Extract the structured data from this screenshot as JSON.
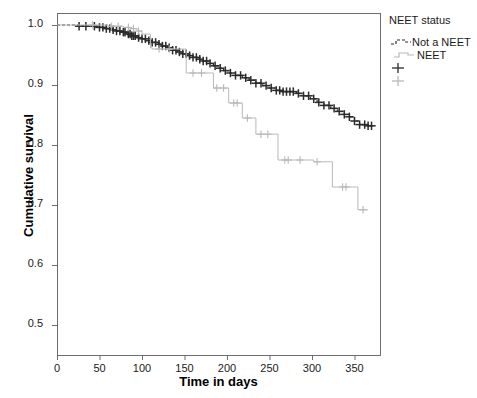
{
  "chart_data": {
    "type": "line",
    "title": "",
    "xlabel": "Time in days",
    "ylabel": "Cumulative survival",
    "xlim": [
      0,
      380
    ],
    "ylim": [
      0.45,
      1.02
    ],
    "xticks": [
      0,
      50,
      100,
      150,
      200,
      250,
      300,
      350
    ],
    "yticks": [
      0.5,
      0.6,
      0.7,
      0.8,
      0.9,
      1.0
    ],
    "ytick_labels": [
      "0.5",
      "0.6",
      "0.7",
      "0.8",
      "0.9",
      "1.0"
    ],
    "xtick_labels": [
      "0",
      "50",
      "100",
      "150",
      "200",
      "250",
      "300",
      "350"
    ],
    "grid": false,
    "legend_position": "right",
    "legend_title": "NEET status",
    "series": [
      {
        "name": "Not a NEET",
        "color": "#2b2b2b",
        "style": "dashed",
        "points": [
          [
            0,
            1.0
          ],
          [
            18,
            1.0
          ],
          [
            24,
            0.998
          ],
          [
            34,
            0.998
          ],
          [
            46,
            0.996
          ],
          [
            52,
            0.996
          ],
          [
            58,
            0.994
          ],
          [
            64,
            0.992
          ],
          [
            70,
            0.99
          ],
          [
            76,
            0.988
          ],
          [
            82,
            0.985
          ],
          [
            88,
            0.982
          ],
          [
            94,
            0.979
          ],
          [
            100,
            0.977
          ],
          [
            106,
            0.974
          ],
          [
            112,
            0.971
          ],
          [
            118,
            0.968
          ],
          [
            124,
            0.965
          ],
          [
            130,
            0.962
          ],
          [
            136,
            0.958
          ],
          [
            142,
            0.955
          ],
          [
            148,
            0.952
          ],
          [
            154,
            0.949
          ],
          [
            160,
            0.946
          ],
          [
            166,
            0.943
          ],
          [
            172,
            0.94
          ],
          [
            178,
            0.936
          ],
          [
            184,
            0.932
          ],
          [
            190,
            0.928
          ],
          [
            196,
            0.924
          ],
          [
            202,
            0.92
          ],
          [
            210,
            0.916
          ],
          [
            218,
            0.912
          ],
          [
            226,
            0.908
          ],
          [
            234,
            0.903
          ],
          [
            242,
            0.899
          ],
          [
            250,
            0.895
          ],
          [
            258,
            0.891
          ],
          [
            266,
            0.889
          ],
          [
            274,
            0.889
          ],
          [
            282,
            0.886
          ],
          [
            290,
            0.882
          ],
          [
            298,
            0.877
          ],
          [
            306,
            0.871
          ],
          [
            314,
            0.866
          ],
          [
            322,
            0.861
          ],
          [
            330,
            0.856
          ],
          [
            338,
            0.851
          ],
          [
            344,
            0.847
          ],
          [
            350,
            0.84
          ],
          [
            356,
            0.834
          ],
          [
            366,
            0.832
          ],
          [
            372,
            0.832
          ]
        ],
        "censor_times": [
          26,
          34,
          44,
          50,
          54,
          58,
          62,
          66,
          70,
          74,
          78,
          80,
          84,
          86,
          88,
          90,
          92,
          96,
          100,
          104,
          108,
          112,
          116,
          120,
          124,
          128,
          132,
          136,
          140,
          144,
          148,
          152,
          156,
          160,
          164,
          168,
          172,
          176,
          180,
          186,
          192,
          198,
          204,
          210,
          216,
          222,
          228,
          234,
          240,
          246,
          252,
          258,
          262,
          266,
          270,
          274,
          278,
          284,
          290,
          296,
          302,
          308,
          314,
          320,
          326,
          332,
          338,
          344,
          350,
          356,
          362,
          366,
          370
        ]
      },
      {
        "name": "NEET",
        "color": "#b8b8b8",
        "style": "solid",
        "points": [
          [
            0,
            1.0
          ],
          [
            30,
            1.0
          ],
          [
            60,
            0.998
          ],
          [
            78,
            0.996
          ],
          [
            86,
            0.994
          ],
          [
            94,
            0.99
          ],
          [
            100,
            0.985
          ],
          [
            110,
            0.962
          ],
          [
            112,
            0.96
          ],
          [
            150,
            0.96
          ],
          [
            152,
            0.92
          ],
          [
            182,
            0.92
          ],
          [
            184,
            0.895
          ],
          [
            200,
            0.895
          ],
          [
            202,
            0.87
          ],
          [
            216,
            0.87
          ],
          [
            218,
            0.845
          ],
          [
            232,
            0.845
          ],
          [
            234,
            0.818
          ],
          [
            258,
            0.818
          ],
          [
            260,
            0.775
          ],
          [
            300,
            0.775
          ],
          [
            302,
            0.772
          ],
          [
            322,
            0.772
          ],
          [
            324,
            0.73
          ],
          [
            352,
            0.73
          ],
          [
            354,
            0.692
          ],
          [
            366,
            0.692
          ]
        ],
        "censor_times": [
          42,
          64,
          72,
          84,
          90,
          96,
          120,
          132,
          160,
          170,
          188,
          196,
          208,
          212,
          224,
          240,
          248,
          268,
          272,
          286,
          306,
          336,
          340,
          360
        ]
      }
    ]
  },
  "axes": {
    "frame_color": "#6e6e6e"
  }
}
